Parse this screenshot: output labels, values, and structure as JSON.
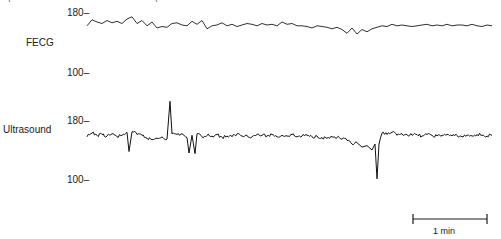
{
  "chart_data": {
    "type": "line",
    "title": "",
    "ylabel": "Fetal heart rate (beats/min)",
    "xlabel": "",
    "panels": [
      {
        "name": "FECG",
        "ylim": [
          100,
          180
        ],
        "yticks": [
          180,
          100
        ],
        "ytick_labels": [
          "180–",
          "100–"
        ],
        "description": "Smooth beat-to-beat trace around 160-170 bpm, slight dip around mid-right (~155 bpm)",
        "x": [
          0,
          5,
          10,
          15,
          20,
          25,
          30,
          35,
          40,
          45,
          50,
          55,
          60,
          65,
          70,
          75,
          80,
          85,
          90,
          95,
          100,
          105,
          110,
          115,
          120,
          125,
          130,
          135,
          140,
          145,
          150,
          155,
          160,
          165,
          170,
          175,
          180,
          185,
          190,
          195,
          200,
          205,
          210,
          215,
          220,
          225,
          230,
          235,
          240,
          245,
          250,
          255,
          260,
          265,
          270,
          275,
          280,
          285,
          290,
          295,
          300,
          305,
          310,
          315,
          320,
          325,
          330,
          335,
          340,
          345,
          350,
          355,
          360,
          365,
          370,
          375,
          380,
          385,
          390,
          395,
          400,
          405
        ],
        "values": [
          163,
          171,
          168,
          166,
          170,
          167,
          169,
          166,
          172,
          175,
          166,
          170,
          163,
          168,
          160,
          162,
          161,
          166,
          167,
          164,
          163,
          169,
          165,
          170,
          159,
          163,
          164,
          167,
          163,
          165,
          162,
          164,
          166,
          165,
          163,
          166,
          164,
          165,
          163,
          168,
          165,
          166,
          163,
          163,
          162,
          160,
          163,
          162,
          161,
          159,
          161,
          158,
          153,
          160,
          152,
          158,
          155,
          159,
          161,
          163,
          162,
          165,
          163,
          164,
          163,
          162,
          163,
          164,
          165,
          163,
          164,
          163,
          165,
          163,
          164,
          164,
          163,
          165,
          163,
          162,
          164,
          163
        ]
      },
      {
        "name": "Ultrasound",
        "ylim": [
          100,
          180
        ],
        "yticks": [
          180,
          100
        ],
        "ytick_labels": [
          "180–",
          "100–"
        ],
        "description": "Noisy trace around 160-165 bpm with artifact spikes: upward spike to ~210 at x≈83, downward spikes to ~135 near x≈42 and x≈100-110, deep dropout to ~103 near x≈290",
        "x": [
          0,
          5,
          10,
          15,
          20,
          25,
          30,
          35,
          40,
          42,
          45,
          50,
          55,
          60,
          65,
          70,
          75,
          80,
          83,
          85,
          90,
          95,
          100,
          102,
          105,
          108,
          110,
          115,
          120,
          125,
          130,
          135,
          140,
          145,
          150,
          155,
          160,
          165,
          170,
          175,
          180,
          185,
          190,
          195,
          200,
          205,
          210,
          215,
          220,
          225,
          230,
          235,
          240,
          245,
          250,
          255,
          260,
          265,
          270,
          275,
          280,
          285,
          288,
          290,
          292,
          295,
          300,
          305,
          310,
          315,
          320,
          325,
          330,
          335,
          340,
          345,
          350,
          355,
          360,
          365,
          370,
          375,
          380,
          385,
          390,
          395,
          400,
          405
        ],
        "values": [
          160,
          165,
          162,
          163,
          161,
          164,
          160,
          162,
          166,
          140,
          167,
          163,
          162,
          158,
          156,
          158,
          160,
          157,
          208,
          164,
          163,
          164,
          159,
          138,
          162,
          137,
          164,
          160,
          162,
          161,
          163,
          159,
          161,
          160,
          164,
          161,
          162,
          160,
          163,
          162,
          161,
          163,
          160,
          162,
          161,
          163,
          160,
          161,
          162,
          160,
          161,
          159,
          158,
          160,
          159,
          157,
          155,
          150,
          152,
          146,
          148,
          142,
          150,
          103,
          150,
          165,
          163,
          166,
          162,
          164,
          163,
          162,
          163,
          161,
          163,
          162,
          161,
          162,
          163,
          161,
          162,
          160,
          162,
          161,
          163,
          162,
          161,
          162
        ]
      }
    ],
    "scale_bar": {
      "label": "1 min",
      "length_px": 74
    },
    "grid": false,
    "legend": null
  },
  "labels": {
    "fecg": "FECG",
    "ultrasound": "Ultrasound",
    "fecg_tick_top": "180–",
    "fecg_tick_bottom": "100–",
    "us_tick_top": "180–",
    "us_tick_bottom": "100–",
    "scale_bar": "1 min"
  },
  "colors": {
    "trace": "#1a1a1a",
    "background": "#ffffff"
  }
}
